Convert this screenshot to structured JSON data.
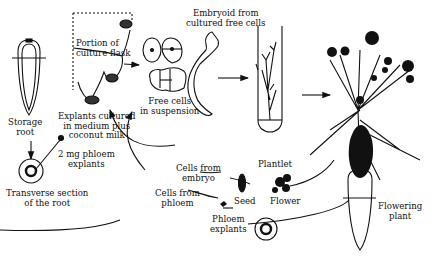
{
  "diagram": {
    "labels": {
      "storage_root": [
        "Storage",
        "root"
      ],
      "transverse_section": [
        "Transverse section",
        "of the root"
      ],
      "explants_cultured": [
        "Explants cultured",
        "in medium plus",
        "coconut milk"
      ],
      "phloem_explants_2mg": [
        "2 mg phloem",
        "explants"
      ],
      "portion_of_flask": [
        "Portion of",
        "culture flask"
      ],
      "free_cells": [
        "Free cells",
        "in suspension"
      ],
      "embryoid": [
        "Embryoid from",
        "cultured free cells"
      ],
      "plantlet": "Plantlet",
      "flowering_plant": [
        "Flowering",
        "plant"
      ],
      "cells_from_embryo": [
        "Cells from",
        "embryo"
      ],
      "cells_from_phloem": [
        "Cells from",
        "phloem"
      ],
      "seed": "Seed",
      "flower": "Flower",
      "phloem_explants": [
        "Phloem",
        "explants"
      ]
    },
    "colors": {
      "ink": "#111111",
      "background": "#ffffff"
    }
  }
}
